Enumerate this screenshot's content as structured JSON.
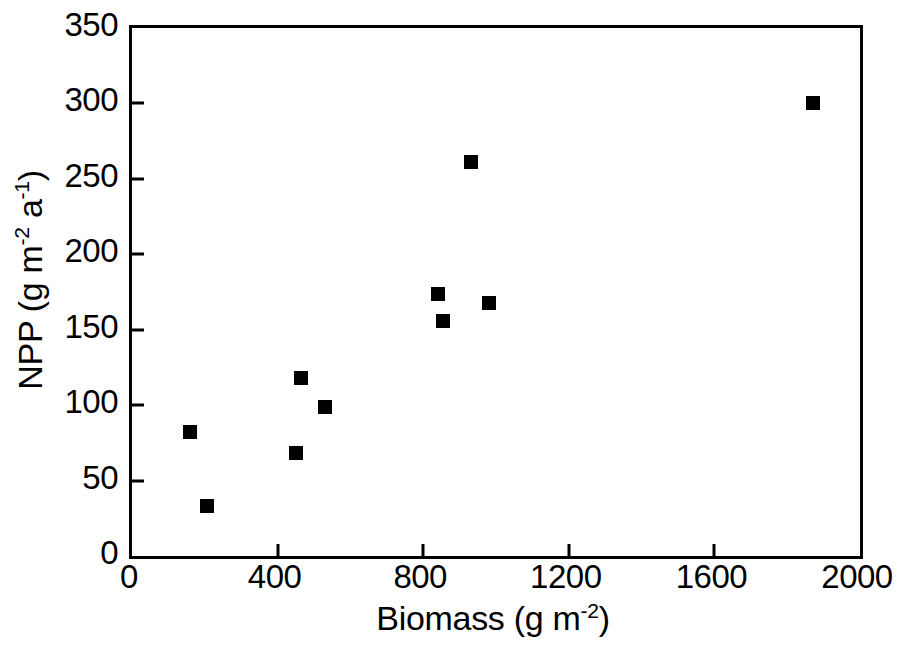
{
  "chart_data": {
    "type": "scatter",
    "title": "",
    "xlabel": "Biomass (g m-2)",
    "ylabel": "NPP (g m-2 a-1)",
    "xlabel_parts": {
      "text": "Biomass (g m",
      "sup": "-2",
      "tail": ")"
    },
    "ylabel_parts": {
      "text": "NPP (g m",
      "sup1": "-2",
      "mid": " a",
      "sup2": "-1",
      "tail": ")"
    },
    "xlim": [
      0,
      2000
    ],
    "ylim": [
      0,
      350
    ],
    "xticks": [
      0,
      400,
      800,
      1200,
      1600,
      2000
    ],
    "yticks": [
      0,
      50,
      100,
      150,
      200,
      250,
      300,
      350
    ],
    "xtick_labels": [
      "0",
      "400",
      "800",
      "1200",
      "1600",
      "2000"
    ],
    "ytick_labels": [
      "0",
      "50",
      "100",
      "150",
      "200",
      "250",
      "300",
      "350"
    ],
    "grid": false,
    "legend": null,
    "marker": {
      "shape": "square",
      "color": "#000000",
      "size_px": 14
    },
    "series": [
      {
        "name": "NPP vs Biomass",
        "points": [
          {
            "x": 160,
            "y": 82
          },
          {
            "x": 205,
            "y": 33
          },
          {
            "x": 450,
            "y": 68
          },
          {
            "x": 465,
            "y": 118
          },
          {
            "x": 530,
            "y": 99
          },
          {
            "x": 840,
            "y": 174
          },
          {
            "x": 855,
            "y": 156
          },
          {
            "x": 930,
            "y": 261
          },
          {
            "x": 980,
            "y": 168
          },
          {
            "x": 1870,
            "y": 300
          }
        ]
      }
    ]
  },
  "colors": {
    "axis": "#000000",
    "marker": "#000000",
    "background": "#ffffff"
  }
}
